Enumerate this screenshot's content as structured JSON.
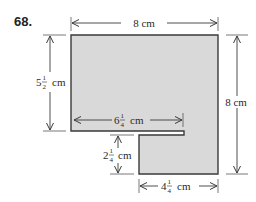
{
  "problem": {
    "number": "68."
  },
  "shape": {
    "fill": "#d9d9d9",
    "stroke": "#3a3a3a"
  },
  "dimensions": {
    "top_width": {
      "whole": "8",
      "unit": "cm",
      "text": "8 cm"
    },
    "left_height": {
      "whole": "5",
      "num": "1",
      "den": "2",
      "unit": "cm",
      "text": "5 1/2 cm"
    },
    "right_height": {
      "whole": "8",
      "unit": "cm",
      "text": "8 cm"
    },
    "notch_length": {
      "whole": "6",
      "num": "1",
      "den": "4",
      "unit": "cm",
      "text": "6 1/4 cm"
    },
    "lower_gap": {
      "whole": "2",
      "num": "1",
      "den": "4",
      "unit": "cm",
      "text": "2 1/4 cm"
    },
    "bottom_width": {
      "whole": "4",
      "num": "1",
      "den": "4",
      "unit": "cm",
      "text": "4 1/4 cm"
    }
  }
}
